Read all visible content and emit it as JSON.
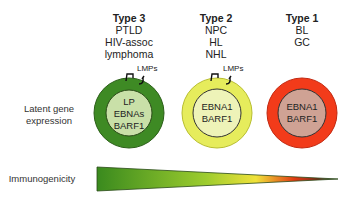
{
  "types": [
    {
      "title": "Type 3",
      "lines": [
        "PTLD",
        "HIV-assoc",
        "lymphoma"
      ],
      "genes": [
        "LP",
        "EBNAs",
        "BARF1"
      ],
      "lmps": "LMPs",
      "outer_color": "#3e8a24",
      "inner_color": "#c9e0a8"
    },
    {
      "title": "Type 2",
      "lines": [
        "NPC",
        "HL",
        "NHL"
      ],
      "genes": [
        "EBNA1",
        "BARF1"
      ],
      "lmps": "LMPs",
      "outer_color": "#e6ec5c",
      "inner_color": "#eef3b8"
    },
    {
      "title": "Type 1",
      "lines": [
        "BL",
        "GC"
      ],
      "genes": [
        "EBNA1",
        "BARF1"
      ],
      "outer_color": "#f23b1a",
      "inner_color": "#cfa294"
    }
  ],
  "row_labels": {
    "latent": [
      "Latent gene",
      "expression"
    ],
    "immunogenicity": "Immunogenicity"
  },
  "gradient": {
    "colors": [
      "#3a8a1e",
      "#9ccc2e",
      "#f2e23a",
      "#e23a12",
      "#222222"
    ]
  }
}
